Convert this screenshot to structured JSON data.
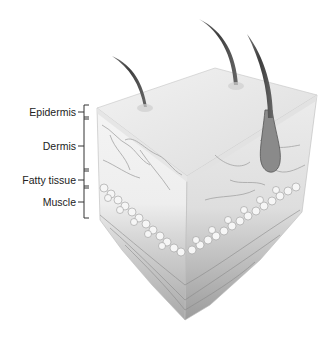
{
  "figure": {
    "labels": [
      {
        "id": "epidermis",
        "text": "Epidermis"
      },
      {
        "id": "dermis",
        "text": "Dermis"
      },
      {
        "id": "fatty-tissue",
        "text": "Fatty tissue"
      },
      {
        "id": "muscle",
        "text": "Muscle"
      }
    ],
    "colors": {
      "label_text": "#222222",
      "bracket": "#333333",
      "skin_top": "#ececec",
      "shading": "#9a9a9a",
      "hair": "#4a4a4a"
    }
  }
}
